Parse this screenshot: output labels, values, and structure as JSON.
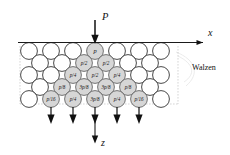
{
  "figure": {
    "applied_load": {
      "symbol": "P",
      "arrow_name": "load-arrow-down"
    },
    "axes": {
      "x": {
        "label": "x",
        "direction": "right"
      },
      "z": {
        "label": "z",
        "direction": "down"
      }
    },
    "side_annotation": "Walzen",
    "colors": {
      "stroke": "#1a1a1a",
      "shaded_fill": "#d6d6d6",
      "plain_fill": "#ffffff",
      "guide": "#b9b9b9"
    },
    "rows": [
      {
        "index": 0,
        "offset": "aligned",
        "count": 7,
        "cells": [
          {
            "label": "",
            "shaded": false
          },
          {
            "label": "",
            "shaded": false
          },
          {
            "label": "",
            "shaded": false
          },
          {
            "label": "p",
            "shaded": true
          },
          {
            "label": "",
            "shaded": false
          },
          {
            "label": "",
            "shaded": false
          },
          {
            "label": "",
            "shaded": false
          }
        ]
      },
      {
        "index": 1,
        "offset": "staggered",
        "count": 6,
        "cells": [
          {
            "label": "",
            "shaded": false
          },
          {
            "label": "",
            "shaded": false
          },
          {
            "label": "p/2",
            "shaded": true
          },
          {
            "label": "p/2",
            "shaded": true
          },
          {
            "label": "",
            "shaded": false
          },
          {
            "label": "",
            "shaded": false
          }
        ]
      },
      {
        "index": 2,
        "offset": "aligned",
        "count": 7,
        "cells": [
          {
            "label": "",
            "shaded": false
          },
          {
            "label": "",
            "shaded": false
          },
          {
            "label": "p/4",
            "shaded": true
          },
          {
            "label": "p/2",
            "shaded": true
          },
          {
            "label": "p/4",
            "shaded": true
          },
          {
            "label": "",
            "shaded": false
          },
          {
            "label": "",
            "shaded": false
          }
        ]
      },
      {
        "index": 3,
        "offset": "staggered",
        "count": 6,
        "cells": [
          {
            "label": "",
            "shaded": false
          },
          {
            "label": "p/8",
            "shaded": true
          },
          {
            "label": "3p/8",
            "shaded": true
          },
          {
            "label": "3p/8",
            "shaded": true
          },
          {
            "label": "p/8",
            "shaded": true
          },
          {
            "label": "",
            "shaded": false
          }
        ]
      },
      {
        "index": 4,
        "offset": "aligned",
        "count": 7,
        "cells": [
          {
            "label": "",
            "shaded": false
          },
          {
            "label": "p/16",
            "shaded": true
          },
          {
            "label": "p/4",
            "shaded": true
          },
          {
            "label": "3p/8",
            "shaded": true
          },
          {
            "label": "p/4",
            "shaded": true
          },
          {
            "label": "p/16",
            "shaded": true
          },
          {
            "label": "",
            "shaded": false
          }
        ]
      }
    ],
    "reaction_arrows": {
      "count": 5,
      "description": "downward reaction arrows under loaded bottom spheres"
    }
  }
}
